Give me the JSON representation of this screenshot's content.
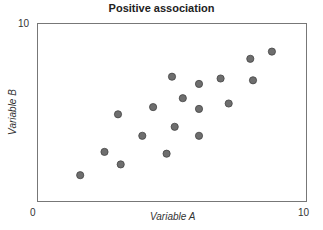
{
  "chart_data": {
    "type": "scatter",
    "title": "Positive association",
    "xlabel": "Variable A",
    "ylabel": "Variable B",
    "xlim": [
      0,
      10
    ],
    "ylim": [
      0,
      10
    ],
    "x_ticks": [
      "0",
      "10"
    ],
    "y_ticks": [
      "10"
    ],
    "grid": false,
    "legend": null,
    "marker_color": "#6e6e6e",
    "marker_edge_color": "#444444",
    "points": [
      {
        "x": 1.6,
        "y": 1.5
      },
      {
        "x": 2.5,
        "y": 2.8
      },
      {
        "x": 3.1,
        "y": 2.1
      },
      {
        "x": 3.0,
        "y": 4.9
      },
      {
        "x": 3.9,
        "y": 3.7
      },
      {
        "x": 4.3,
        "y": 5.3
      },
      {
        "x": 4.8,
        "y": 2.7
      },
      {
        "x": 5.1,
        "y": 4.2
      },
      {
        "x": 5.0,
        "y": 7.0
      },
      {
        "x": 5.4,
        "y": 5.8
      },
      {
        "x": 6.0,
        "y": 6.6
      },
      {
        "x": 6.0,
        "y": 5.2
      },
      {
        "x": 6.0,
        "y": 3.7
      },
      {
        "x": 6.8,
        "y": 6.9
      },
      {
        "x": 7.1,
        "y": 5.5
      },
      {
        "x": 7.9,
        "y": 8.0
      },
      {
        "x": 8.0,
        "y": 6.8
      },
      {
        "x": 8.7,
        "y": 8.4
      }
    ]
  }
}
